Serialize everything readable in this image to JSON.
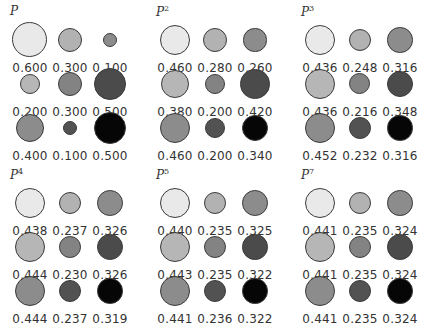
{
  "chart_data": {
    "type": "bubble-grid",
    "title": "",
    "matrices": [
      {
        "label": "P",
        "base": "P",
        "power": "",
        "values": [
          [
            0.6,
            0.3,
            0.1
          ],
          [
            0.2,
            0.3,
            0.5
          ],
          [
            0.4,
            0.1,
            0.5
          ]
        ],
        "labels": [
          [
            "0.600",
            "0.300",
            "0.100"
          ],
          [
            "0.200",
            "0.300",
            "0.500"
          ],
          [
            "0.400",
            "0.100",
            "0.500"
          ]
        ]
      },
      {
        "label": "P^2",
        "base": "P",
        "power": "2",
        "values": [
          [
            0.46,
            0.28,
            0.26
          ],
          [
            0.38,
            0.2,
            0.42
          ],
          [
            0.46,
            0.2,
            0.34
          ]
        ],
        "labels": [
          [
            "0.460",
            "0.280",
            "0.260"
          ],
          [
            "0.380",
            "0.200",
            "0.420"
          ],
          [
            "0.460",
            "0.200",
            "0.340"
          ]
        ]
      },
      {
        "label": "P^3",
        "base": "P",
        "power": "3",
        "values": [
          [
            0.436,
            0.248,
            0.316
          ],
          [
            0.436,
            0.216,
            0.348
          ],
          [
            0.452,
            0.232,
            0.316
          ]
        ],
        "labels": [
          [
            "0.436",
            "0.248",
            "0.316"
          ],
          [
            "0.436",
            "0.216",
            "0.348"
          ],
          [
            "0.452",
            "0.232",
            "0.316"
          ]
        ]
      },
      {
        "label": "P^4",
        "base": "P",
        "power": "4",
        "values": [
          [
            0.438,
            0.237,
            0.326
          ],
          [
            0.444,
            0.23,
            0.326
          ],
          [
            0.444,
            0.237,
            0.319
          ]
        ],
        "labels": [
          [
            "0.438",
            "0.237",
            "0.326"
          ],
          [
            "0.444",
            "0.230",
            "0.326"
          ],
          [
            "0.444",
            "0.237",
            "0.319"
          ]
        ]
      },
      {
        "label": "P^5",
        "base": "P",
        "power": "5",
        "values": [
          [
            0.44,
            0.235,
            0.325
          ],
          [
            0.443,
            0.235,
            0.322
          ],
          [
            0.441,
            0.236,
            0.322
          ]
        ],
        "labels": [
          [
            "0.440",
            "0.235",
            "0.325"
          ],
          [
            "0.443",
            "0.235",
            "0.322"
          ],
          [
            "0.441",
            "0.236",
            "0.322"
          ]
        ]
      },
      {
        "label": "P^7",
        "base": "P",
        "power": "7",
        "values": [
          [
            0.441,
            0.235,
            0.324
          ],
          [
            0.441,
            0.235,
            0.324
          ],
          [
            0.441,
            0.235,
            0.324
          ]
        ],
        "labels": [
          [
            "0.441",
            "0.235",
            "0.324"
          ],
          [
            "0.441",
            "0.235",
            "0.324"
          ],
          [
            "0.441",
            "0.235",
            "0.324"
          ]
        ]
      }
    ]
  },
  "colors": {
    "cells": [
      [
        "#e9e9e9",
        "#b2b2b2",
        "#8c8c8c"
      ],
      [
        "#b6b6b6",
        "#838383",
        "#4b4b4b"
      ],
      [
        "#8c8c8c",
        "#525252",
        "#060606"
      ]
    ],
    "stroke": "#3a3a3a",
    "text": "#333333"
  },
  "layout": {
    "panel_origins": [
      [
        0,
        0
      ],
      [
        145,
        0
      ],
      [
        290,
        0
      ],
      [
        0,
        163
      ],
      [
        145,
        163
      ],
      [
        290,
        163
      ]
    ],
    "col_centers": [
      30,
      70,
      110
    ],
    "row_centers": [
      40,
      84,
      128
    ],
    "text_offsets": [
      61,
      105,
      149
    ],
    "label_pos": [
      10,
      4
    ],
    "radius_scale": 22.6
  }
}
